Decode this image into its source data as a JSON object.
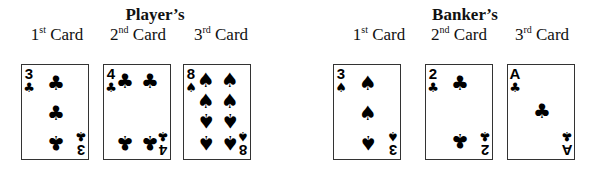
{
  "player": {
    "title": "Player’s",
    "cards": [
      {
        "label_num": "1",
        "label_sup": "st",
        "label_text": " Card",
        "rank": "3",
        "suit": "♣",
        "suit_name": "clubs"
      },
      {
        "label_num": "2",
        "label_sup": "nd",
        "label_text": " Card",
        "rank": "4",
        "suit": "♣",
        "suit_name": "clubs"
      },
      {
        "label_num": "3",
        "label_sup": "rd",
        "label_text": " Card",
        "rank": "8",
        "suit": "♠",
        "suit_name": "spades"
      }
    ]
  },
  "banker": {
    "title": "Banker’s",
    "cards": [
      {
        "label_num": "1",
        "label_sup": "st",
        "label_text": " Card",
        "rank": "3",
        "suit": "♠",
        "suit_name": "spades"
      },
      {
        "label_num": "2",
        "label_sup": "nd",
        "label_text": " Card",
        "rank": "2",
        "suit": "♣",
        "suit_name": "clubs"
      },
      {
        "label_num": "3",
        "label_sup": "rd",
        "label_text": " Card",
        "rank": "A",
        "suit": "♣",
        "suit_name": "clubs"
      }
    ]
  }
}
